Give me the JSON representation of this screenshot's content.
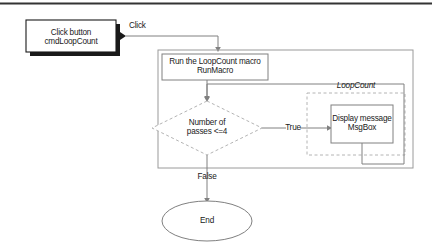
{
  "diagram": {
    "title_bar_present": true,
    "nodes": {
      "trigger": {
        "name": "click-button-node",
        "line1": "Click button",
        "line2": "cmdLoopCount",
        "shape": "rectangle-with-shadow"
      },
      "macro": {
        "name": "run-macro-node",
        "line1": "Run the LoopCount macro",
        "line2": "RunMacro",
        "shape": "rectangle"
      },
      "decision": {
        "name": "decision-node",
        "line1": "Number of",
        "line2": "passes <=4",
        "shape": "diamond-dashed"
      },
      "action": {
        "name": "display-message-node",
        "line1": "Display message",
        "line2": "MsgBox",
        "shape": "rectangle"
      },
      "end": {
        "name": "end-node",
        "line1": "End",
        "shape": "ellipse"
      }
    },
    "groups": {
      "loopcount": {
        "name": "loopcount-group",
        "label": "LoopCount"
      }
    },
    "edges": {
      "click": {
        "name": "click-edge",
        "label": "Click"
      },
      "true": {
        "name": "true-edge",
        "label": "True"
      },
      "false": {
        "name": "false-edge",
        "label": "False"
      }
    },
    "colors": {
      "line": "#808080",
      "dark_line": "#1a1a1a",
      "shadow": "#1a1a1a",
      "text": "#1a1a1a",
      "background": "#ffffff",
      "top_rule": "#333333"
    }
  }
}
